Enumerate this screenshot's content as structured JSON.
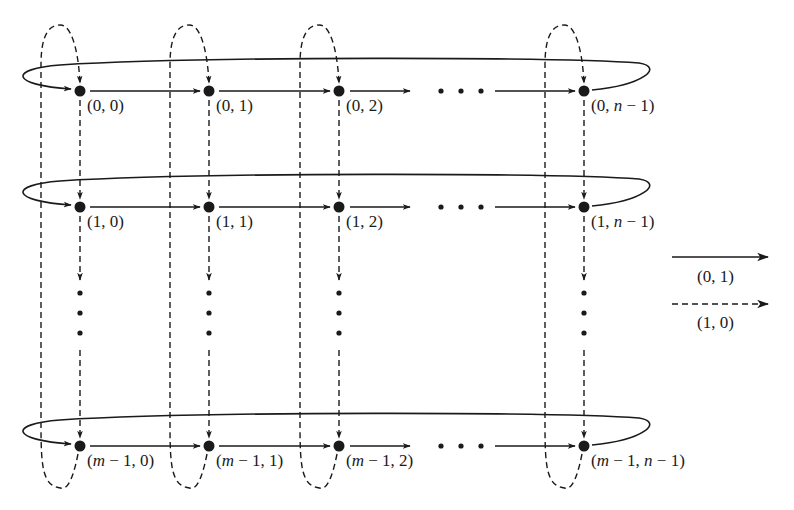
{
  "diagram": {
    "colors": {
      "ink": "#1a1a1a",
      "background": "#ffffff"
    },
    "columns": [
      {
        "index": "0",
        "x": 80
      },
      {
        "index": "1",
        "x": 209
      },
      {
        "index": "2",
        "x": 339
      },
      {
        "index": "n-1",
        "x": 584
      }
    ],
    "rows": [
      {
        "index": "0",
        "y": 91
      },
      {
        "index": "1",
        "y": 207
      },
      {
        "index": "m-1",
        "y": 446
      }
    ],
    "nodes": [
      {
        "row": 0,
        "col": 0,
        "label": "(0, 0)"
      },
      {
        "row": 0,
        "col": 1,
        "label": "(0, 1)"
      },
      {
        "row": 0,
        "col": 2,
        "label": "(0, 2)"
      },
      {
        "row": 0,
        "col": 3,
        "label": "(0, n − 1)"
      },
      {
        "row": 1,
        "col": 0,
        "label": "(1, 0)"
      },
      {
        "row": 1,
        "col": 1,
        "label": "(1, 1)"
      },
      {
        "row": 1,
        "col": 2,
        "label": "(1, 2)"
      },
      {
        "row": 1,
        "col": 3,
        "label": "(1, n − 1)"
      },
      {
        "row": 2,
        "col": 0,
        "label": "(m − 1, 0)"
      },
      {
        "row": 2,
        "col": 1,
        "label": "(m − 1, 1)"
      },
      {
        "row": 2,
        "col": 2,
        "label": "(m − 1, 2)"
      },
      {
        "row": 2,
        "col": 3,
        "label": "(m − 1, n − 1)"
      }
    ],
    "horizontal_ellipsis": "· · ·",
    "vertical_ellipsis": "⋮",
    "legend": [
      {
        "style": "solid",
        "label": "(0, 1)"
      },
      {
        "style": "dashed",
        "label": "(1, 0)"
      }
    ]
  }
}
